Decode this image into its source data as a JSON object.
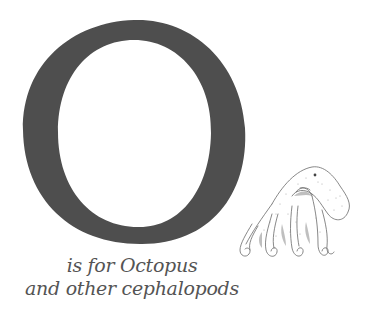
{
  "page": {
    "letter": "O",
    "caption": {
      "line1": "is for Octopus",
      "line2": "and other cephalopods"
    },
    "illustration": "octopus-drawing",
    "colors": {
      "letter": "#4e4e4e",
      "caption": "#545454",
      "ink": "#6a6a6a",
      "background": "#ffffff"
    }
  }
}
